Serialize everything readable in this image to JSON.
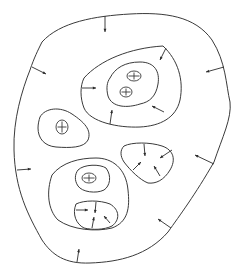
{
  "diagram": {
    "width": 239,
    "height": 272,
    "stroke_color": "#3a3a3a",
    "background": "#ffffff",
    "regions": [
      {
        "name": "outer-boundary",
        "path": "M42,42 C60,22 95,16 130,14 C165,12 195,16 212,40 C226,62 226,85 230,102 C232,118 222,138 214,162 C195,195 180,215 168,232 C148,255 120,262 90,263 C65,264 52,255 42,240 C28,215 15,190 14,150 C13,120 22,90 30,70 C34,58 38,50 42,42 Z"
      },
      {
        "name": "upper-cluster-outer-ring",
        "path": "M84,78 C100,60 130,48 163,46 C178,60 184,80 180,100 C176,118 160,126 140,127 C118,128 90,122 84,108 C80,98 80,86 84,78 Z"
      },
      {
        "name": "upper-cluster-inner-ring",
        "path": "M110,78 C115,68 125,62 140,62 C155,62 160,72 158,84 C156,96 150,102 140,104 C128,108 112,108 108,96 C106,88 107,82 110,78 Z"
      },
      {
        "name": "left-region",
        "path": "M40,117 C45,108 60,106 72,114 C84,122 92,130 88,140 C84,148 70,148 56,147 C44,146 38,138 38,128 C38,124 39,120 40,117 Z"
      },
      {
        "name": "middle-right-region",
        "path": "M124,146 C132,142 150,142 162,146 C174,150 176,160 170,170 C164,180 156,184 148,183 C140,180 130,170 124,162 C120,156 120,150 124,146 Z"
      },
      {
        "name": "lower-cluster-outer-ring",
        "path": "M52,175 C62,162 80,158 96,158 C112,158 126,168 128,190 C130,208 128,222 112,228 C96,232 72,230 58,220 C48,210 46,192 52,175 Z"
      },
      {
        "name": "lower-cluster-inner-ring",
        "path": "M78,170 C84,164 100,164 106,168 C112,176 110,186 104,190 C96,194 82,192 78,186 C74,180 75,174 78,170 Z"
      },
      {
        "name": "lower-inner-region",
        "path": "M76,204 C84,200 100,200 110,204 C120,210 120,220 112,226 C104,230 92,230 84,228 C76,224 72,214 76,204 Z"
      }
    ],
    "cells": [
      {
        "name": "upper-cell-1",
        "cx": 134,
        "cy": 76,
        "rx": 7,
        "ry": 5
      },
      {
        "name": "upper-cell-2",
        "cx": 126,
        "cy": 92,
        "rx": 6,
        "ry": 5
      },
      {
        "name": "left-cell",
        "cx": 62,
        "cy": 127,
        "rx": 6,
        "ry": 7
      },
      {
        "name": "lower-cell",
        "cx": 89,
        "cy": 178,
        "rx": 7,
        "ry": 5
      }
    ],
    "arrows": [
      {
        "x1": 105,
        "y1": 16,
        "x2": 105,
        "y2": 32
      },
      {
        "x1": 32,
        "y1": 67,
        "x2": 46,
        "y2": 74
      },
      {
        "x1": 224,
        "y1": 67,
        "x2": 206,
        "y2": 72
      },
      {
        "x1": 17,
        "y1": 170,
        "x2": 31,
        "y2": 169
      },
      {
        "x1": 214,
        "y1": 164,
        "x2": 195,
        "y2": 155
      },
      {
        "x1": 171,
        "y1": 228,
        "x2": 158,
        "y2": 219
      },
      {
        "x1": 77,
        "y1": 262,
        "x2": 79,
        "y2": 249
      },
      {
        "x1": 82,
        "y1": 88,
        "x2": 96,
        "y2": 88
      },
      {
        "x1": 166,
        "y1": 48,
        "x2": 160,
        "y2": 60
      },
      {
        "x1": 164,
        "y1": 112,
        "x2": 152,
        "y2": 106
      },
      {
        "x1": 110,
        "y1": 124,
        "x2": 112,
        "y2": 110
      },
      {
        "x1": 144,
        "y1": 144,
        "x2": 145,
        "y2": 156
      },
      {
        "x1": 172,
        "y1": 150,
        "x2": 160,
        "y2": 158
      },
      {
        "x1": 133,
        "y1": 170,
        "x2": 141,
        "y2": 162
      },
      {
        "x1": 160,
        "y1": 176,
        "x2": 154,
        "y2": 166
      },
      {
        "x1": 76,
        "y1": 210,
        "x2": 88,
        "y2": 210
      },
      {
        "x1": 96,
        "y1": 202,
        "x2": 95,
        "y2": 213
      },
      {
        "x1": 92,
        "y1": 228,
        "x2": 94,
        "y2": 217
      },
      {
        "x1": 110,
        "y1": 223,
        "x2": 104,
        "y2": 216
      }
    ]
  }
}
